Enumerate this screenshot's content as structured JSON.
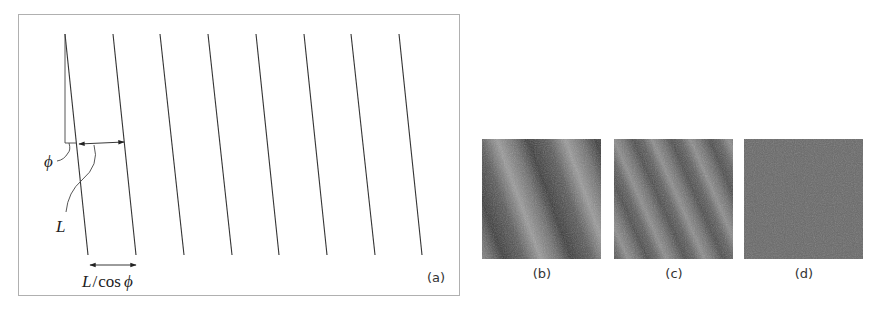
{
  "panel_a": {
    "label": "(a)",
    "frame": {
      "x": 18,
      "y": 14,
      "width": 441,
      "height": 281,
      "stroke": "#b0b0b0"
    },
    "lines": [
      {
        "x1": 65,
        "y1": 34,
        "x2": 88,
        "y2": 255
      },
      {
        "x1": 113,
        "y1": 34,
        "x2": 136,
        "y2": 255
      },
      {
        "x1": 160,
        "y1": 34,
        "x2": 184,
        "y2": 255
      },
      {
        "x1": 208,
        "y1": 34,
        "x2": 232,
        "y2": 255
      },
      {
        "x1": 256,
        "y1": 34,
        "x2": 279,
        "y2": 255
      },
      {
        "x1": 304,
        "y1": 34,
        "x2": 327,
        "y2": 255
      },
      {
        "x1": 351,
        "y1": 34,
        "x2": 375,
        "y2": 255
      },
      {
        "x1": 399,
        "y1": 34,
        "x2": 422,
        "y2": 255
      }
    ],
    "line_color": "#333333",
    "annotations": {
      "phi_symbol": "ϕ",
      "L_symbol": "L",
      "L_over_cos_phi": {
        "L": "L",
        "slash": "/",
        "cos": "cos",
        "phi": "ϕ"
      }
    }
  },
  "panels": [
    {
      "id": "b",
      "label": "(b)",
      "pattern": "broad diagonal stripes"
    },
    {
      "id": "c",
      "label": "(c)",
      "pattern": "fine diagonal stripes"
    },
    {
      "id": "d",
      "label": "(d)",
      "pattern": "uniform gray noise"
    }
  ]
}
